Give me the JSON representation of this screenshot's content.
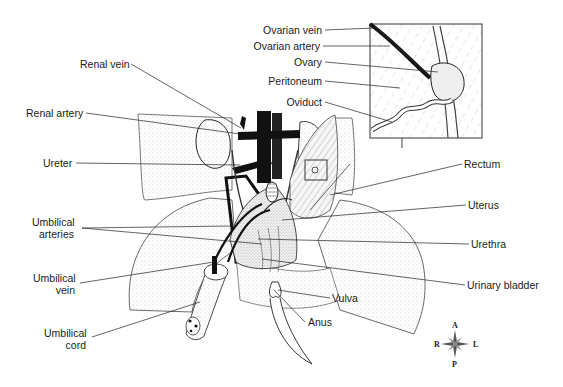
{
  "figure": {
    "labels_left": [
      {
        "id": "renal-vein",
        "text": "Renal vein"
      },
      {
        "id": "renal-artery",
        "text": "Renal artery"
      },
      {
        "id": "ureter",
        "text": "Ureter"
      },
      {
        "id": "umbilical-arteries",
        "line1": "Umbilical",
        "line2": "arteries"
      },
      {
        "id": "umbilical-vein",
        "line1": "Umbilical",
        "line2": "vein"
      },
      {
        "id": "umbilical-cord",
        "line1": "Umbilical",
        "line2": "cord"
      }
    ],
    "labels_right": [
      {
        "id": "rectum",
        "text": "Rectum"
      },
      {
        "id": "uterus",
        "text": "Uterus"
      },
      {
        "id": "urethra",
        "text": "Urethra"
      },
      {
        "id": "urinary-bladder",
        "text": "Urinary bladder"
      },
      {
        "id": "vulva",
        "text": "Vulva"
      },
      {
        "id": "anus",
        "text": "Anus"
      }
    ],
    "inset_labels": [
      {
        "id": "ovarian-vein",
        "text": "Ovarian vein"
      },
      {
        "id": "ovarian-artery",
        "text": "Ovarian artery"
      },
      {
        "id": "ovary",
        "text": "Ovary"
      },
      {
        "id": "peritoneum",
        "text": "Peritoneum"
      },
      {
        "id": "oviduct",
        "text": "Oviduct"
      }
    ],
    "compass": {
      "anterior": "A",
      "posterior": "P",
      "right": "R",
      "left": "L"
    },
    "colors": {
      "ink": "#1a1a1a",
      "stipple": "#bdbdbd",
      "vessel": "#111111"
    }
  }
}
